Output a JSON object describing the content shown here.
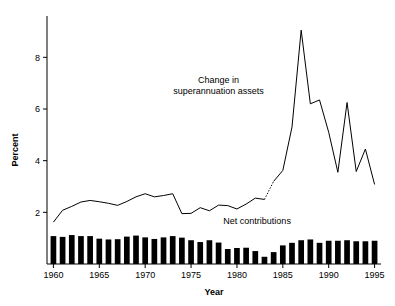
{
  "chart_data": {
    "type": "line",
    "title": "",
    "subtitle": "",
    "xlabel": "Year",
    "ylabel": "Percent",
    "xlim": [
      1959.3,
      1995.7
    ],
    "ylim": [
      0,
      9.6
    ],
    "xticks": [
      1960,
      1965,
      1970,
      1975,
      1980,
      1985,
      1990,
      1995
    ],
    "xticklabels": [
      "1960",
      "1965",
      "1970",
      "1975",
      "1980",
      "1985",
      "1990",
      "1995"
    ],
    "yticks": [
      2,
      4,
      6,
      8
    ],
    "yticklabels": [
      "2",
      "4",
      "6",
      "8"
    ],
    "grid": false,
    "legend_position": "inline-annotation",
    "annotations": [
      {
        "name": "change-in-superannuation-assets",
        "text_line1": "Change in",
        "text_line2": "superannuation assets",
        "x": 1978.0,
        "y": 7.0
      },
      {
        "name": "net-contributions",
        "text_line1": "Net contributions",
        "text_line2": "",
        "x": 1982.2,
        "y": 1.55
      }
    ],
    "series": [
      {
        "name": "Change in superannuation assets",
        "type": "line",
        "color": "#000000",
        "linestyle_note": "solid except dotted between 1983 and 1984",
        "dotted_segment": [
          1983,
          1984
        ],
        "x": [
          1960,
          1961,
          1962,
          1963,
          1964,
          1965,
          1966,
          1967,
          1968,
          1969,
          1970,
          1971,
          1972,
          1973,
          1974,
          1975,
          1976,
          1977,
          1978,
          1979,
          1980,
          1981,
          1982,
          1983,
          1984,
          1985,
          1986,
          1987,
          1988,
          1989,
          1990,
          1991,
          1992,
          1993,
          1994,
          1995
        ],
        "values": [
          1.62,
          2.08,
          2.23,
          2.4,
          2.46,
          2.41,
          2.35,
          2.27,
          2.42,
          2.6,
          2.72,
          2.6,
          2.65,
          2.72,
          1.95,
          1.96,
          2.18,
          2.06,
          2.28,
          2.26,
          2.13,
          2.32,
          2.55,
          2.5,
          3.2,
          3.62,
          5.3,
          9.05,
          6.2,
          6.35,
          5.1,
          3.55,
          6.25,
          3.58,
          4.45,
          3.08
        ]
      },
      {
        "name": "Net contributions",
        "type": "bar",
        "color": "#000000",
        "x": [
          1960,
          1961,
          1962,
          1963,
          1964,
          1965,
          1966,
          1967,
          1968,
          1969,
          1970,
          1971,
          1972,
          1973,
          1974,
          1975,
          1976,
          1977,
          1978,
          1979,
          1980,
          1981,
          1982,
          1983,
          1984,
          1985,
          1986,
          1987,
          1988,
          1989,
          1990,
          1991,
          1992,
          1993,
          1994,
          1995
        ],
        "values": [
          1.08,
          1.05,
          1.12,
          1.08,
          1.08,
          0.98,
          0.95,
          0.96,
          1.06,
          1.1,
          1.03,
          0.97,
          1.03,
          1.08,
          1.02,
          0.92,
          0.85,
          0.92,
          0.83,
          0.58,
          0.62,
          0.63,
          0.5,
          0.28,
          0.46,
          0.72,
          0.82,
          0.92,
          0.95,
          0.82,
          0.9,
          0.9,
          0.92,
          0.88,
          0.88,
          0.9
        ]
      }
    ]
  },
  "axes": {
    "y_axis_label": "Percent",
    "x_axis_label": "Year"
  }
}
